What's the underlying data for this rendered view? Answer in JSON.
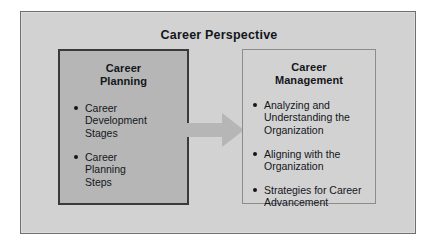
{
  "figure": {
    "title": "Career Perspective",
    "colors": {
      "page_background": "#ffffff",
      "panel_background": "#d2d2d2",
      "panel_border": "#6f6f6f",
      "planning_box_fill": "#b6b6b6",
      "planning_box_border": "#3a3a3a",
      "management_box_fill": "#d2d2d2",
      "management_box_border": "#8c8c8c",
      "arrow_fill": "#b6b6b6",
      "text": "#14161c"
    }
  },
  "boxes": [
    {
      "id": "career-planning",
      "heading_lines": [
        "Career",
        "Planning"
      ],
      "bullets": [
        {
          "lines": [
            "Career",
            "Development",
            "Stages"
          ]
        },
        {
          "lines": [
            "Career",
            "Planning",
            "Steps"
          ]
        }
      ]
    },
    {
      "id": "career-management",
      "heading_lines": [
        "Career",
        "Management"
      ],
      "bullets": [
        {
          "lines": [
            "Analyzing and",
            "Understanding the",
            "Organization"
          ]
        },
        {
          "lines": [
            "Aligning with the",
            "Organization"
          ]
        },
        {
          "lines": [
            "Strategies for Career",
            "Advancement"
          ]
        }
      ]
    }
  ],
  "connector": {
    "icon": "right-arrow-icon",
    "direction": "right",
    "from": "career-planning",
    "to": "career-management"
  }
}
